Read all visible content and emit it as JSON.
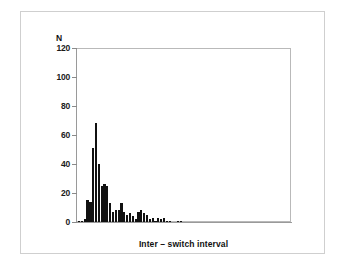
{
  "figure": {
    "background_color": "#ffffff",
    "frame_color": "#cfcfcf",
    "axis_color": "#9a9a9a",
    "bar_color": "#111111"
  },
  "chart_data": {
    "type": "bar",
    "title": "",
    "subtitle": "",
    "xlabel": "Inter – switch interval",
    "ylabel": "N",
    "ylim": [
      0,
      120
    ],
    "yticks": [
      0,
      20,
      40,
      60,
      80,
      100,
      120
    ],
    "ytick_labels": [
      "0",
      "20",
      "40",
      "60",
      "80",
      "100",
      "120"
    ],
    "xticks": [],
    "xtick_labels": [],
    "grid": false,
    "legend": false,
    "legend_position": "none",
    "bin_count": 46,
    "categories": [
      "1",
      "2",
      "3",
      "4",
      "5",
      "6",
      "7",
      "8",
      "9",
      "10",
      "11",
      "12",
      "13",
      "14",
      "15",
      "16",
      "17",
      "18",
      "19",
      "20",
      "21",
      "22",
      "23",
      "24",
      "25",
      "26",
      "27",
      "28",
      "29",
      "30",
      "31",
      "32",
      "33",
      "34",
      "35",
      "36",
      "37",
      "38",
      "39",
      "40",
      "41",
      "42",
      "43",
      "44",
      "45",
      "46"
    ],
    "values": [
      1,
      1,
      2,
      15,
      14,
      51,
      68,
      40,
      25,
      26,
      25,
      13,
      7,
      8,
      8,
      13,
      7,
      5,
      6,
      4,
      2,
      7,
      8,
      6,
      5,
      2,
      3,
      1,
      3,
      2,
      3,
      1,
      1,
      0,
      0,
      1,
      1,
      0,
      0,
      0,
      0,
      0,
      0,
      0,
      0,
      0
    ],
    "series": [
      {
        "name": "Inter-switch interval counts",
        "values": [
          1,
          1,
          2,
          15,
          14,
          51,
          68,
          40,
          25,
          26,
          25,
          13,
          7,
          8,
          8,
          13,
          7,
          5,
          6,
          4,
          2,
          7,
          8,
          6,
          5,
          2,
          3,
          1,
          3,
          2,
          3,
          1,
          1,
          0,
          0,
          1,
          1,
          0,
          0,
          0,
          0,
          0,
          0,
          0,
          0,
          0
        ]
      }
    ],
    "annotations": []
  }
}
